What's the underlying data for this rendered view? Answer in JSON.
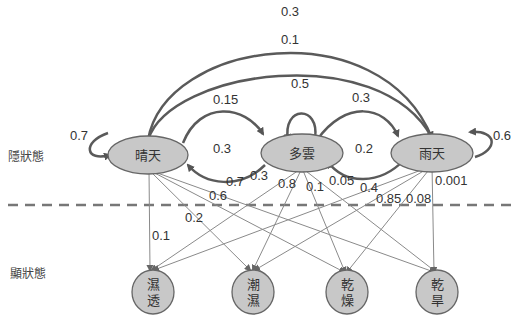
{
  "labels": {
    "hidden_states": "隱狀態",
    "observed_states": "顯狀態"
  },
  "hidden": [
    {
      "id": "sunny",
      "label": "晴天"
    },
    {
      "id": "cloudy",
      "label": "多雲"
    },
    {
      "id": "rainy",
      "label": "雨天"
    }
  ],
  "observed": [
    {
      "id": "soggy",
      "line1": "濕",
      "line2": "透"
    },
    {
      "id": "damp",
      "line1": "潮",
      "line2": "濕"
    },
    {
      "id": "dry",
      "line1": "乾",
      "line2": "燥"
    },
    {
      "id": "dryish",
      "line1": "乾",
      "line2": "旱"
    }
  ],
  "transitions": {
    "sunny_sunny": "0.7",
    "sunny_cloudy": "0.15",
    "cloudy_sunny": "0.3",
    "cloudy_cloudy": "0.5",
    "cloudy_rainy": "0.3",
    "rainy_cloudy": "0.2",
    "rainy_rainy": "0.6",
    "sunny_rainy_outer": "0.3",
    "sunny_rainy_inner": "0.1"
  },
  "emissions": {
    "sunny_soggy": "0.1",
    "sunny_damp": "0.2",
    "sunny_dry": "0.6",
    "sunny_dryish": "0.7",
    "cloudy_soggy": "0.3",
    "cloudy_damp": "0.8",
    "cloudy_dry": "0.1",
    "cloudy_dryish": "0.05",
    "rainy_soggy": "0.4",
    "rainy_damp": "0.85",
    "rainy_dry": "0.08",
    "rainy_dryish": "0.001"
  },
  "colors": {
    "node_fill": "#c8c8c8",
    "node_stroke": "#666666",
    "arc": "#5a5a5a",
    "emission_line": "#8a8a8a",
    "divider": "#777777"
  }
}
